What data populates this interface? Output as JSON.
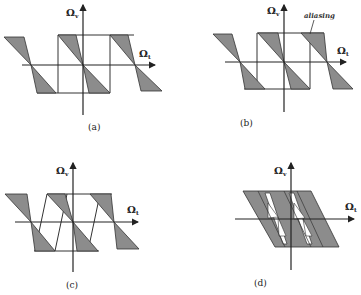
{
  "figure": {
    "panels": [
      {
        "id": "a",
        "caption": "(a)",
        "y_axis": "Ω",
        "y_sub": "v",
        "x_axis": "Ω",
        "x_sub": "t"
      },
      {
        "id": "b",
        "caption": "(b)",
        "y_axis": "Ω",
        "y_sub": "v",
        "x_axis": "Ω",
        "x_sub": "t",
        "annotation": "aliasing"
      },
      {
        "id": "c",
        "caption": "(c)",
        "y_axis": "Ω",
        "y_sub": "v",
        "x_axis": "Ω",
        "x_sub": "t"
      },
      {
        "id": "d",
        "caption": "(d)",
        "y_axis": "Ω",
        "y_sub": "v",
        "x_axis": "Ω",
        "x_sub": "t"
      }
    ],
    "colors": {
      "fill": "#8c8c8c",
      "line": "#333333",
      "background": "#ffffff"
    }
  }
}
